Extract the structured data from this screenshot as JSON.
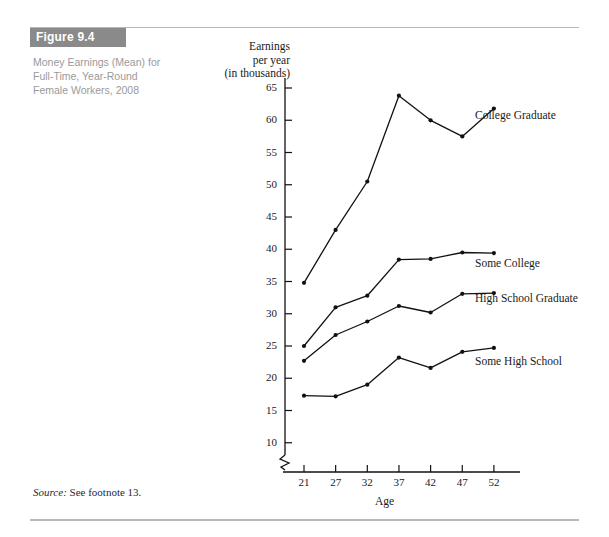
{
  "figure": {
    "tab_label": "Figure 9.4",
    "caption_lines": [
      "Money Earnings (Mean) for",
      "Full-Time, Year-Round",
      "Female Workers, 2008"
    ]
  },
  "source": {
    "label": "Source:",
    "text": " See footnote 13."
  },
  "chart_data": {
    "type": "line",
    "title": "Money Earnings (Mean) for Full-Time, Year-Round Female Workers, 2008",
    "xlabel": "Age",
    "ylabel": "Earnings per year (in thousands)",
    "ylabel_lines": [
      "Earnings",
      "per year",
      "(in thousands)"
    ],
    "x": [
      21,
      27,
      32,
      37,
      42,
      47,
      52
    ],
    "xtick_labels": [
      "21",
      "27",
      "32",
      "37",
      "42",
      "47",
      "52"
    ],
    "ytick_labels": [
      "10",
      "15",
      "20",
      "25",
      "30",
      "35",
      "40",
      "45",
      "50",
      "55",
      "60",
      "65"
    ],
    "yticks": [
      10,
      15,
      20,
      25,
      30,
      35,
      40,
      45,
      50,
      55,
      60,
      65
    ],
    "ylim": [
      7,
      67
    ],
    "xlim": [
      18,
      55
    ],
    "axis_break": true,
    "grid": false,
    "legend_position": "inline-right",
    "marker": "filled-circle",
    "line_color": "#111111",
    "series": [
      {
        "name": "College Graduate",
        "label_x": 52,
        "label_y": 60.5,
        "values": [
          34.8,
          43.0,
          50.5,
          63.8,
          60.0,
          57.5,
          61.8
        ]
      },
      {
        "name": "Some College",
        "label_x": 52,
        "label_y": 37.5,
        "values": [
          25.0,
          31.0,
          32.8,
          38.4,
          38.5,
          39.5,
          39.4
        ]
      },
      {
        "name": "High School Graduate",
        "label_x": 52,
        "label_y": 32.2,
        "values": [
          22.7,
          26.7,
          28.8,
          31.2,
          30.2,
          33.1,
          33.2
        ]
      },
      {
        "name": "Some High School",
        "label_x": 52,
        "label_y": 22.4,
        "values": [
          17.3,
          17.2,
          19.0,
          23.2,
          21.6,
          24.1,
          24.7
        ]
      }
    ]
  }
}
